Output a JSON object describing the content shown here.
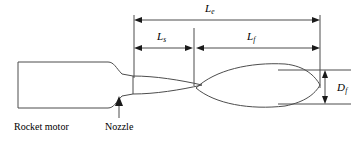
{
  "figure": {
    "background_color": "#ffffff",
    "line_color": "#4d4d4d",
    "text_color": "#000000"
  },
  "labels": {
    "plume_total_length": {
      "symbol": "L",
      "subscript": "e"
    },
    "shock_cell_length": {
      "symbol": "L",
      "subscript": "s"
    },
    "flame_length": {
      "symbol": "L",
      "subscript": "f"
    },
    "plume_diameter": {
      "symbol": "D",
      "subscript": "f"
    }
  },
  "callouts": {
    "rocket_motor": "Rocket motor",
    "nozzle": "Nozzle"
  },
  "dimensions": [
    {
      "name": "Le",
      "orientation": "horizontal",
      "x_start": 134,
      "x_end": 320,
      "y": 20
    },
    {
      "name": "Ls",
      "orientation": "horizontal",
      "x_start": 134,
      "x_end": 193,
      "y": 48
    },
    {
      "name": "Lf",
      "orientation": "horizontal",
      "x_start": 196,
      "x_end": 320,
      "y": 48
    },
    {
      "name": "Df",
      "orientation": "vertical",
      "x": 325,
      "y_start": 70,
      "y_end": 104
    }
  ],
  "geometry": {
    "motor_body": {
      "x": 18,
      "y": 62,
      "width": 90,
      "height": 46
    },
    "nozzle_throat_x": 122,
    "nozzle_exit_x": 133,
    "shock_cell_1": {
      "x_start": 134,
      "x_end": 202,
      "half_height": 9
    },
    "shock_cell_2": {
      "x_start": 196,
      "x_end": 320,
      "half_height": 17
    }
  }
}
